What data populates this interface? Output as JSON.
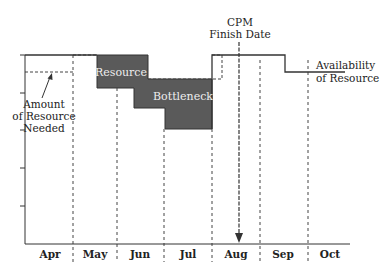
{
  "diagram": {
    "months": [
      "Apr",
      "May",
      "Jun",
      "Jul",
      "Aug",
      "Sep",
      "Oct"
    ],
    "labels": {
      "cpm_line1": "CPM",
      "cpm_line2": "Finish Date",
      "needed_line1": "Amount",
      "needed_line2": "of Resource",
      "needed_line3": "Needed",
      "availability_line1": "Availability",
      "availability_line2": "of Resource",
      "bottleneck_word1": "Resource",
      "bottleneck_word2": "Bottleneck"
    },
    "colors": {
      "bottleneck_fill": "#5a5a5a",
      "line": "#333333"
    }
  }
}
